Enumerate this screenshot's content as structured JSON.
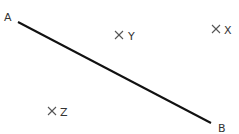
{
  "diagram": {
    "segment": {
      "start": {
        "label": "A",
        "x": 18,
        "y": 22
      },
      "end": {
        "label": "B",
        "x": 211,
        "y": 123
      },
      "color": "#111111"
    },
    "points": [
      {
        "name": "Y",
        "label": "Y",
        "mark": "×",
        "x": 119,
        "y": 35
      },
      {
        "name": "X",
        "label": "X",
        "mark": "×",
        "x": 216,
        "y": 29
      },
      {
        "name": "Z",
        "label": "Z",
        "mark": "×",
        "x": 53,
        "y": 111
      }
    ]
  }
}
